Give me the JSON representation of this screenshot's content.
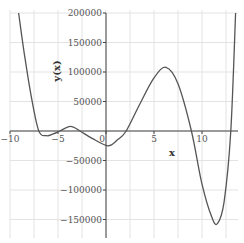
{
  "chart_data": {
    "type": "line",
    "title": "",
    "xlabel": "x",
    "ylabel": "y(x)",
    "xlim": [
      -10,
      13
    ],
    "ylim": [
      -170000,
      205000
    ],
    "grid": true,
    "legend": null,
    "x_ticks": [
      -10,
      -5,
      0,
      5,
      10
    ],
    "x_tick_labels": [
      "−10",
      "−5",
      "0",
      "5",
      "10"
    ],
    "y_ticks": [
      200000,
      150000,
      100000,
      50000,
      -50000,
      -100000,
      -150000
    ],
    "y_tick_labels": [
      "200000",
      "150000",
      "100000",
      "50000",
      "−50000",
      "−100000",
      "−150000"
    ],
    "series": [
      {
        "name": "y(x)",
        "color": "#555555",
        "x": [
          -9.1,
          -8.5,
          -7.8,
          -7.0,
          -6.2,
          -5.5,
          -4.8,
          -3.7,
          -2.7,
          -1.5,
          0.2,
          1.2,
          2.1,
          3.5,
          5.0,
          6.25,
          7.5,
          8.9,
          10.0,
          11.0,
          11.6,
          12.3,
          13.0,
          13.5
        ],
        "y": [
          200000,
          130000,
          60000,
          0,
          -8000,
          -5000,
          0,
          8000,
          0,
          -12000,
          -25000,
          -15000,
          0,
          45000,
          90000,
          108000,
          80000,
          0,
          -90000,
          -145000,
          -157000,
          -120000,
          0,
          200000
        ]
      }
    ]
  },
  "labels": {
    "x_axis": "x",
    "y_axis": "y(x)"
  },
  "colors": {
    "curve": "#555555",
    "axis": "#444444",
    "grid": "#e3e3e3",
    "text": "#555555"
  }
}
